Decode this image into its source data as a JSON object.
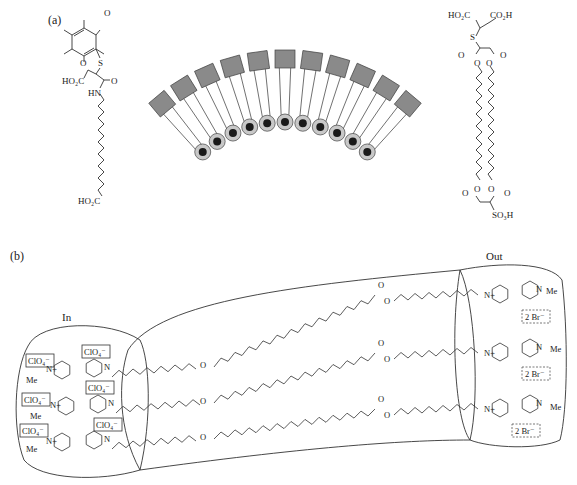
{
  "panel_a": {
    "label": "(a)",
    "left_molecule": {
      "quinone_o_top": "O",
      "quinone_o_bottom": "O",
      "sulfur": "S",
      "acid_group": "HO₂C",
      "carbonyl_o": "O",
      "amide_nh": "HN",
      "terminal_acid": "HO₂C"
    },
    "right_molecule": {
      "acid_left": "HO₂C",
      "acid_right": "CO₂H",
      "sulfur": "S",
      "carbonyl_left": "O",
      "carbonyl_right": "O",
      "ester_o_left": "O",
      "ester_o_right": "O",
      "bottom_ester_o_left": "O",
      "bottom_ester_o_right": "O",
      "bottom_carbonyl_left": "O",
      "bottom_carbonyl_right": "O",
      "sulfonic": "SO₃H"
    },
    "arc_assembly": {
      "count": 11
    }
  },
  "panel_b": {
    "label": "(b)",
    "in_label": "In",
    "out_label": "Out",
    "inner_counterions": [
      "ClO₄⁻",
      "ClO₄⁻",
      "ClO₄⁻",
      "ClO₄⁻",
      "ClO₄⁻",
      "ClO₄⁻"
    ],
    "outer_counterions": [
      "2 Br⁻",
      "2 Br⁻",
      "2 Br⁻"
    ],
    "methyl": "Me",
    "nitrogen_plus": "N",
    "ester_o": "O"
  },
  "colors": {
    "line": "#333333",
    "head_fill": "#8a8a8a",
    "bead_outer": "#c8c8c8",
    "bead_inner": "#1a1a1a"
  }
}
